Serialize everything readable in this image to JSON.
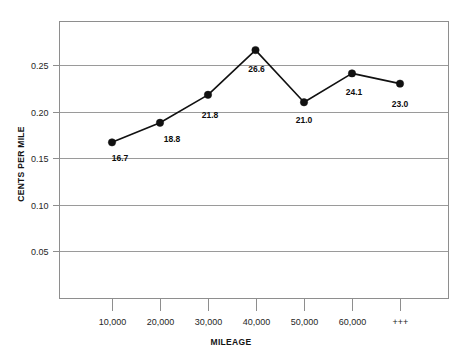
{
  "chart_data": {
    "type": "line",
    "title": "",
    "subtitle": "",
    "xlabel": "MILEAGE",
    "ylabel": "CENTS PER MILE",
    "categories": [
      "10,000",
      "20,000",
      "30,000",
      "40,000",
      "50,000",
      "60,000",
      "+++"
    ],
    "values": [
      0.167,
      0.188,
      0.218,
      0.266,
      0.21,
      0.241,
      0.23
    ],
    "point_labels": [
      "16.7",
      "18.8",
      "21.8",
      "26.6",
      "21.0",
      "24.1",
      "23.0"
    ],
    "ylim": [
      0.0,
      0.3
    ],
    "yticks": [
      0.05,
      0.1,
      0.15,
      0.2,
      0.25
    ],
    "ytick_labels": [
      "0.05",
      "0.10",
      "0.15",
      "0.20",
      "0.25"
    ],
    "grid": true,
    "grid_axis": "y",
    "legend": false,
    "legend_position": "none",
    "series": [
      {
        "name": "cents per mile",
        "values": [
          0.167,
          0.188,
          0.218,
          0.266,
          0.21,
          0.241,
          0.23
        ]
      }
    ],
    "marker": "filled-circle",
    "line_color": "#111111",
    "marker_color": "#111111",
    "grid_color": "#9a9a9a",
    "frame_color": "#8e8e8e",
    "background_color": "#ffffff"
  },
  "axes": {
    "y_axis_title": "CENTS PER MILE",
    "x_axis_title": "MILEAGE"
  }
}
